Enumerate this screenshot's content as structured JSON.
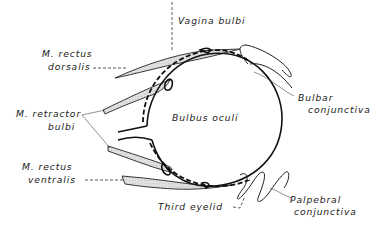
{
  "figure": {
    "type": "anatomical-diagram",
    "labels": {
      "vagina_bulbi": "Vagina bulbi",
      "rectus_dorsalis_1": "M. rectus",
      "rectus_dorsalis_2": "dorsalis",
      "retractor_bulbi_1": "M. retractor",
      "retractor_bulbi_2": "bulbi",
      "rectus_ventralis_1": "M. rectus",
      "rectus_ventralis_2": "ventralis",
      "bulbus_oculi": "Bulbus oculi",
      "bulbar_conjunctiva_1": "Bulbar",
      "bulbar_conjunctiva_2": "conjunctiva",
      "third_eyelid": "Third eyelid",
      "palpebral_conjunctiva_1": "Palpebral",
      "palpebral_conjunctiva_2": "conjunctiva"
    },
    "colors": {
      "line": "#111111",
      "stipple": "#cfcfcf",
      "background": "#ffffff"
    }
  }
}
